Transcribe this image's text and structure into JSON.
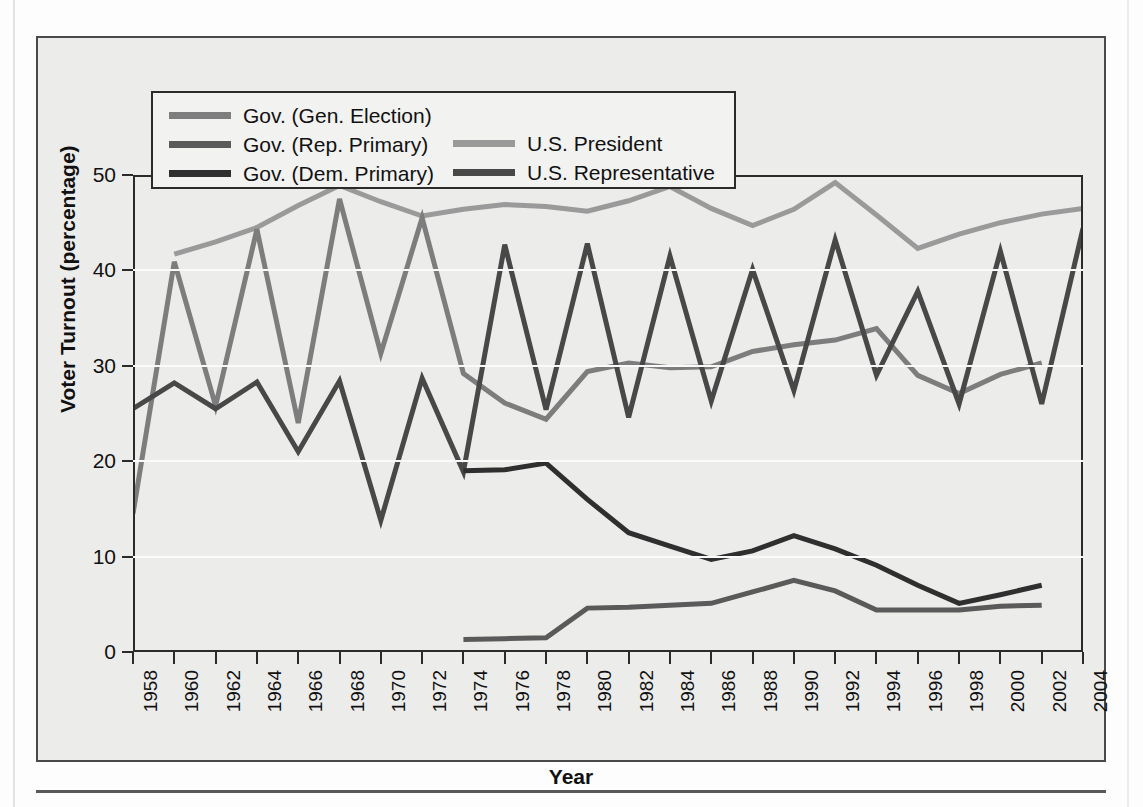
{
  "chart_data": {
    "type": "line",
    "title": "",
    "xlabel": "Year",
    "ylabel": "Voter Turnout (percentage)",
    "ylim": [
      0,
      50
    ],
    "yticks": [
      0,
      10,
      20,
      30,
      40,
      50
    ],
    "grid": true,
    "legend_position": "top-left-inside",
    "x": [
      1958,
      1960,
      1962,
      1964,
      1966,
      1968,
      1970,
      1972,
      1974,
      1976,
      1978,
      1980,
      1982,
      1984,
      1986,
      1988,
      1990,
      1992,
      1994,
      1996,
      1998,
      2000,
      2002,
      2004
    ],
    "xtick_labels": [
      "1958",
      "1960",
      "1962",
      "1964",
      "1966",
      "1968",
      "1970",
      "1972",
      "1974",
      "1976",
      "1978",
      "1980",
      "1982",
      "1984",
      "1986",
      "1988",
      "1990",
      "1992",
      "1994",
      "1996",
      "1998",
      "2000",
      "2002",
      "2004"
    ],
    "series": [
      {
        "name": "Gov. (Gen. Election)",
        "color": "#7d7d7d",
        "x": [
          1958,
          1960,
          1962,
          1964,
          1966,
          1968,
          1970,
          1972,
          1974,
          1976,
          1978,
          1980,
          1982,
          1984,
          1986,
          1988,
          1990,
          1992,
          1994,
          1996,
          1998,
          2000,
          2002
        ],
        "values": [
          14.5,
          40.9,
          25.8,
          44.3,
          24.0,
          47.5,
          31.3,
          45.5,
          29.2,
          26.1,
          24.4,
          29.4,
          30.3,
          29.8,
          29.9,
          31.5,
          32.2,
          32.7,
          33.9,
          29.0,
          27.1,
          29.1,
          30.3
        ]
      },
      {
        "name": "Gov. (Rep. Primary)",
        "color": "#5a5a5a",
        "x": [
          1974,
          1976,
          1978,
          1980,
          1982,
          1984,
          1986,
          1988,
          1990,
          1992,
          1994,
          1996,
          1998,
          2000,
          2002
        ],
        "values": [
          1.3,
          1.4,
          1.5,
          4.6,
          4.7,
          4.9,
          5.1,
          6.3,
          7.5,
          6.4,
          4.4,
          4.4,
          4.4,
          4.8,
          4.9
        ]
      },
      {
        "name": "Gov. (Dem. Primary)",
        "color": "#2f2f2f",
        "x": [
          1974,
          1976,
          1978,
          1980,
          1982,
          1984,
          1986,
          1988,
          1990,
          1992,
          1994,
          1996,
          1998,
          2000,
          2002
        ],
        "values": [
          19.0,
          19.1,
          19.8,
          16.0,
          12.5,
          11.1,
          9.7,
          10.6,
          12.2,
          10.8,
          9.1,
          7.0,
          5.1,
          6.0,
          7.0
        ]
      },
      {
        "name": "U.S. President",
        "color": "#9a9a9a",
        "x": [
          1960,
          1962,
          1964,
          1966,
          1968,
          1970,
          1972,
          1974,
          1976,
          1978,
          1980,
          1982,
          1984,
          1986,
          1988,
          1990,
          1992,
          1994,
          1996,
          1998,
          2000,
          2002,
          2004
        ],
        "values": [
          41.7,
          43.0,
          44.5,
          46.8,
          48.9,
          47.2,
          45.7,
          46.4,
          46.9,
          46.7,
          46.2,
          47.3,
          48.8,
          46.5,
          44.7,
          46.4,
          49.2,
          45.8,
          42.3,
          43.8,
          45.0,
          45.9,
          46.5
        ]
      },
      {
        "name": "U.S. Representative",
        "color": "#484848",
        "x": [
          1958,
          1960,
          1962,
          1964,
          1966,
          1968,
          1970,
          1972,
          1974,
          1976,
          1978,
          1980,
          1982,
          1984,
          1986,
          1988,
          1990,
          1992,
          1994,
          1996,
          1998,
          2000,
          2002,
          2004
        ],
        "values": [
          25.5,
          28.2,
          25.5,
          28.3,
          21.0,
          28.4,
          13.8,
          28.7,
          18.9,
          42.7,
          25.4,
          42.8,
          24.6,
          41.5,
          26.3,
          40.1,
          27.4,
          43.2,
          29.0,
          37.8,
          26.0,
          42.0,
          26.0,
          44.4
        ]
      }
    ]
  },
  "legend": {
    "items_left": [
      {
        "label": "Gov. (Gen. Election)",
        "color": "#7d7d7d"
      },
      {
        "label": "Gov. (Rep. Primary)",
        "color": "#5a5a5a"
      },
      {
        "label": "Gov. (Dem. Primary)",
        "color": "#2f2f2f"
      }
    ],
    "items_right": [
      {
        "label": "U.S. President",
        "color": "#9a9a9a"
      },
      {
        "label": "U.S. Representative",
        "color": "#484848"
      }
    ]
  },
  "axis_titles": {
    "x": "Year",
    "y": "Voter Turnout (percentage)"
  }
}
